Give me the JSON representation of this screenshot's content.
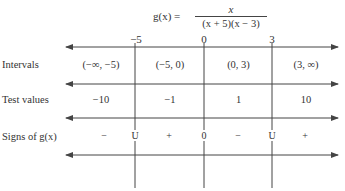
{
  "title": {
    "lhs": "g(x) =",
    "numerator": "x",
    "denominator": "(x + 5)(x − 3)"
  },
  "critical_points": [
    {
      "label": "−5",
      "x": 135
    },
    {
      "label": "0",
      "x": 204
    },
    {
      "label": "3",
      "x": 272
    }
  ],
  "rows": {
    "intervals": {
      "label": "Intervals",
      "cells": [
        "(−∞, −5)",
        "(−5, 0)",
        "(0, 3)",
        "(3, ∞)"
      ]
    },
    "test_values": {
      "label": "Test values",
      "cells": [
        "−10",
        "−1",
        "1",
        "10"
      ]
    },
    "signs": {
      "label": "Signs of g(x)",
      "cells": [
        "−",
        "+",
        "−",
        "+"
      ],
      "markers": [
        "U",
        "0",
        "U"
      ]
    }
  },
  "colors": {
    "line": "#444444",
    "text": "#333333",
    "background": "#ffffff"
  }
}
